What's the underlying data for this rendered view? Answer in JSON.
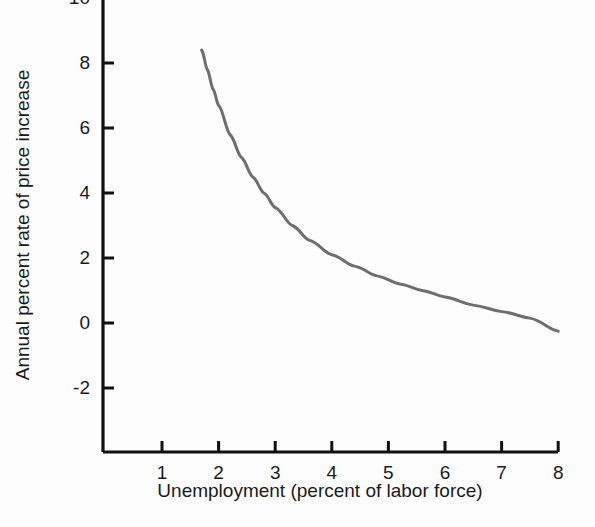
{
  "chart_data": {
    "type": "line",
    "title": "",
    "xlabel": "Unemployment (percent of labor force)",
    "ylabel": "Annual percent rate of price increase",
    "xlim": [
      0.5,
      8.3
    ],
    "ylim": [
      -3.2,
      10.4
    ],
    "xticks": [
      "1",
      "2",
      "3",
      "4",
      "5",
      "6",
      "7",
      "8"
    ],
    "xtick_values": [
      1,
      2,
      3,
      4,
      5,
      6,
      7,
      8
    ],
    "yticks": [
      "10",
      "8",
      "6",
      "4",
      "2",
      "0",
      "-2"
    ],
    "ytick_values": [
      10,
      8,
      6,
      4,
      2,
      0,
      -2
    ],
    "grid": false,
    "legend": null,
    "series": [
      {
        "name": "Phillips curve",
        "color": "#6e6e6e",
        "linewidth": 3,
        "x": [
          1.7,
          1.8,
          1.9,
          2.0,
          2.2,
          2.4,
          2.6,
          2.8,
          3.0,
          3.3,
          3.6,
          4.0,
          4.4,
          4.8,
          5.2,
          5.6,
          6.0,
          6.5,
          7.0,
          7.5,
          8.0
        ],
        "y": [
          8.4,
          7.8,
          7.2,
          6.7,
          5.8,
          5.1,
          4.5,
          4.0,
          3.55,
          3.0,
          2.55,
          2.1,
          1.75,
          1.45,
          1.2,
          1.0,
          0.8,
          0.55,
          0.35,
          0.15,
          -0.25
        ]
      }
    ]
  },
  "axis": {
    "color": "#111111",
    "tick_direction": "inward"
  },
  "style": {
    "background": "#fdfdfd",
    "text_color": "#1a1a1a"
  }
}
